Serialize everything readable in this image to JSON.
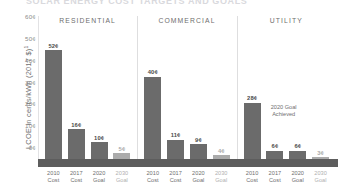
{
  "chart_data": {
    "type": "bar",
    "title": "SOLAR ENERGY COST TARGETS AND GOALS",
    "ylabel": "LCOE in cents/kWh (2017 $)",
    "ylabel_footnote": "1",
    "xlabel": "",
    "ylim": [
      0,
      60
    ],
    "grid": false,
    "legend": "none",
    "y_ticks": [
      "0¢",
      "10¢",
      "20¢",
      "30¢",
      "40¢",
      "50¢",
      "60¢"
    ],
    "y_tick_values": [
      0,
      10,
      20,
      30,
      40,
      50,
      60
    ],
    "categories": [
      "2010 Cost",
      "2017 Cost",
      "2020 Goal",
      "2030 Goal"
    ],
    "category_lines": [
      {
        "line1": "2010",
        "line2": "Cost"
      },
      {
        "line1": "2017",
        "line2": "Cost"
      },
      {
        "line1": "2020",
        "line2": "Goal"
      },
      {
        "line1": "2030",
        "line2": "Goal"
      }
    ],
    "panels": [
      {
        "name": "RESIDENTIAL",
        "values": [
          52,
          16,
          10,
          5
        ],
        "labels": [
          "52¢",
          "16¢",
          "10¢",
          "5¢"
        ],
        "annotation": ""
      },
      {
        "name": "COMMERCIAL",
        "values": [
          40,
          11,
          9,
          4
        ],
        "labels": [
          "40¢",
          "11¢",
          "9¢",
          "4¢"
        ],
        "annotation": ""
      },
      {
        "name": "UTILITY",
        "values": [
          28,
          6,
          6,
          3
        ],
        "labels": [
          "28¢",
          "6¢",
          "6¢",
          "3¢"
        ],
        "annotation": "2020 Goal\nAchieved"
      }
    ],
    "colors": {
      "bar_dark": "#6b6b6b",
      "bar_light": "#ababab",
      "baseline": "#5d5d5d",
      "text": "#6f6f6f",
      "value_text": "#4a4a4a",
      "axis": "#e2e2e4"
    }
  }
}
